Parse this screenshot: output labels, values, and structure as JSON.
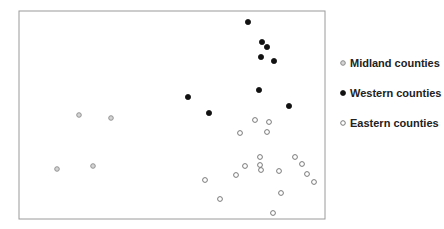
{
  "chart_data": {
    "type": "scatter",
    "title": "",
    "xlabel": "",
    "ylabel": "",
    "axes_visible": false,
    "grid": false,
    "frame": true,
    "legend_position": "right",
    "pixel_space": {
      "note": "coordinates are read in image pixel space; the plot has no tick labels",
      "frame": {
        "left": 19,
        "top": 11,
        "right": 325,
        "bottom": 219
      }
    },
    "series": [
      {
        "name": "Midland counties",
        "marker": "circle-gray",
        "color": "#8a8a8a",
        "fill": "#d4d4d4",
        "points": [
          [
            79,
            115
          ],
          [
            111,
            118
          ],
          [
            57,
            169
          ],
          [
            93,
            166
          ]
        ]
      },
      {
        "name": "Western counties",
        "marker": "circle-filled",
        "color": "#111111",
        "fill": "#111111",
        "points": [
          [
            248,
            22
          ],
          [
            262,
            42
          ],
          [
            267,
            47
          ],
          [
            261,
            57
          ],
          [
            274,
            61
          ],
          [
            259,
            90
          ],
          [
            188,
            97
          ],
          [
            209,
            113
          ],
          [
            289,
            106
          ]
        ]
      },
      {
        "name": "Eastern counties",
        "marker": "circle-hollow",
        "color": "#6a6a6a",
        "fill": "#ffffff",
        "points": [
          [
            255,
            120
          ],
          [
            269,
            122
          ],
          [
            240,
            133
          ],
          [
            267,
            132
          ],
          [
            260,
            157
          ],
          [
            245,
            166
          ],
          [
            260,
            165
          ],
          [
            261,
            170
          ],
          [
            236,
            175
          ],
          [
            279,
            171
          ],
          [
            295,
            157
          ],
          [
            302,
            164
          ],
          [
            307,
            174
          ],
          [
            314,
            182
          ],
          [
            205,
            180
          ],
          [
            281,
            193
          ],
          [
            220,
            199
          ],
          [
            273,
            213
          ]
        ]
      }
    ],
    "legend": [
      {
        "label": "Midland counties",
        "marker": "circle-gray"
      },
      {
        "label": "Western counties",
        "marker": "circle-filled"
      },
      {
        "label": "Eastern counties",
        "marker": "circle-hollow"
      }
    ]
  },
  "legend": {
    "items": [
      {
        "label": "Midland counties"
      },
      {
        "label": "Western counties"
      },
      {
        "label": "Eastern counties"
      }
    ]
  },
  "colors": {
    "frame": "#9a9a9a",
    "text": "#222222"
  }
}
